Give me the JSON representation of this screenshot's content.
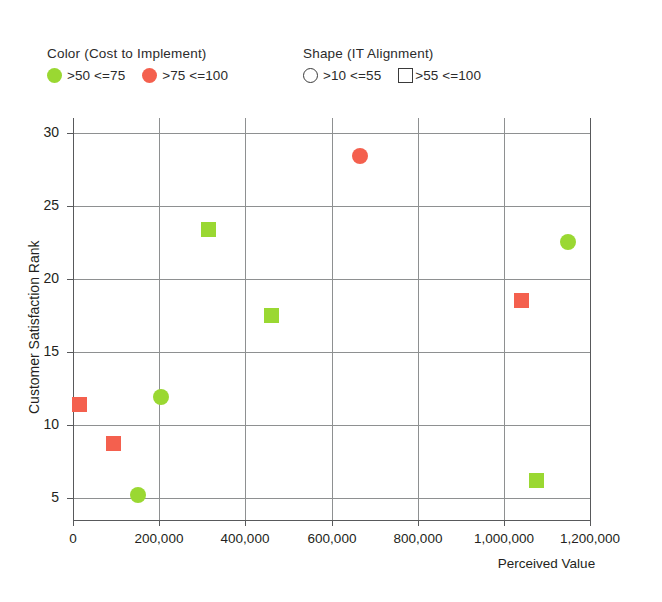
{
  "legend": {
    "color": {
      "title": "Color (Cost to Implement)",
      "entries": [
        {
          "label": ">50  <=75",
          "color": "#9ad832",
          "shape": "circle"
        },
        {
          "label": ">75  <=100",
          "color": "#f4604e",
          "shape": "circle"
        }
      ]
    },
    "shape": {
      "title": "Shape (IT Alignment)",
      "entries": [
        {
          "label": ">10  <=55",
          "shape": "circle-outline"
        },
        {
          "label": ">55  <=100",
          "shape": "square-outline"
        }
      ]
    }
  },
  "chart_data": {
    "type": "scatter",
    "title": "",
    "xlabel": "Perceived Value",
    "ylabel": "Customer Satisfaction Rank",
    "xlim": [
      0,
      1200000
    ],
    "ylim": [
      3.5,
      31
    ],
    "xticks": [
      0,
      200000,
      400000,
      600000,
      800000,
      1000000,
      1200000
    ],
    "xtick_labels": [
      "0",
      "200,000",
      "400,000",
      "600,000",
      "800,000",
      "1,000,000",
      "1,200,000"
    ],
    "yticks": [
      5,
      10,
      15,
      20,
      25,
      30
    ],
    "ytick_labels": [
      "5",
      "10",
      "15",
      "20",
      "25",
      "30"
    ],
    "grid": true,
    "legend_position": "top",
    "colors": {
      "green": "#9ad832",
      "red": "#f4604e",
      "grid": "#8e9091",
      "axis": "#58595b"
    },
    "encodings": {
      "color": "Cost to Implement",
      "shape": "IT Alignment"
    },
    "points": [
      {
        "x": 15000,
        "y": 11.4,
        "color": "#f4604e",
        "shape": "square"
      },
      {
        "x": 95000,
        "y": 8.7,
        "color": "#f4604e",
        "shape": "square"
      },
      {
        "x": 150000,
        "y": 5.2,
        "color": "#9ad832",
        "shape": "circle"
      },
      {
        "x": 205000,
        "y": 11.9,
        "color": "#9ad832",
        "shape": "circle"
      },
      {
        "x": 315000,
        "y": 23.4,
        "color": "#9ad832",
        "shape": "square"
      },
      {
        "x": 460000,
        "y": 17.5,
        "color": "#9ad832",
        "shape": "square"
      },
      {
        "x": 665000,
        "y": 28.4,
        "color": "#f4604e",
        "shape": "circle"
      },
      {
        "x": 1040000,
        "y": 18.5,
        "color": "#f4604e",
        "shape": "square"
      },
      {
        "x": 1075000,
        "y": 6.2,
        "color": "#9ad832",
        "shape": "square"
      },
      {
        "x": 1150000,
        "y": 22.5,
        "color": "#9ad832",
        "shape": "circle"
      }
    ]
  },
  "geometry": {
    "plot_left": 73,
    "plot_right": 590,
    "plot_top": 118,
    "plot_bottom": 520
  }
}
